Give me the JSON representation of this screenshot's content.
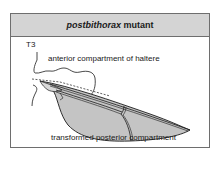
{
  "header": {
    "title_italic": "postbithorax",
    "title_rest": " mutant"
  },
  "labels": {
    "segment": "T3",
    "anterior": "anterior compartment of haltere",
    "posterior": "transformed posterior compartment"
  },
  "colors": {
    "header_bg": "#d4d4d4",
    "frame": "#6e6e6e",
    "wing_fill": "#c4c4c4",
    "line": "#1a1a1a"
  }
}
